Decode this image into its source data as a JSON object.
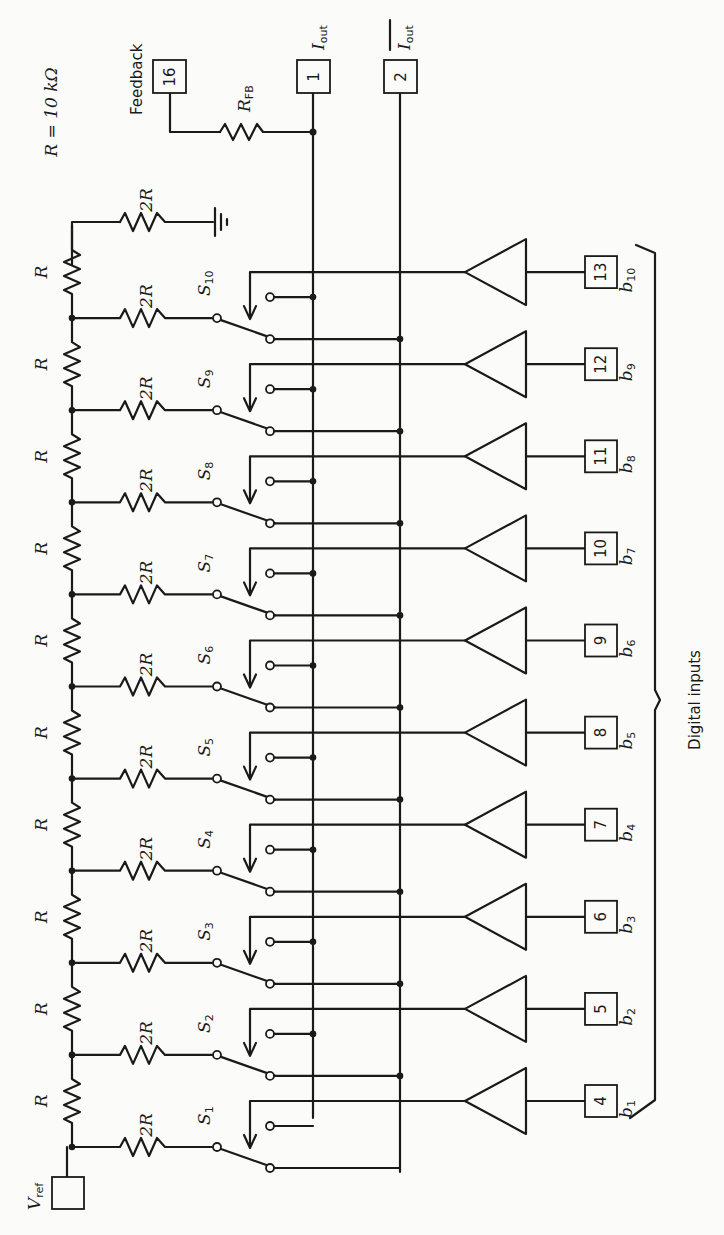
{
  "diagram": {
    "type": "R-2R ladder 10-bit multiplying DAC (rotated 90°)",
    "resistor_note": "R = 10 kΩ",
    "vref_label": "V",
    "vref_sub": "ref",
    "ladder_series_label": "R",
    "ladder_shunt_label": "2R",
    "feedback_label": "Feedback",
    "rfb_label": "R",
    "rfb_sub": "FB",
    "iout_label": "I",
    "iout_sub": "out",
    "iout_bar_label": "I",
    "iout_bar_sub": "out",
    "digital_inputs_label": "Digital inputs",
    "pins": {
      "feedback": "16",
      "iout": "1",
      "iout_bar": "2"
    },
    "bits": [
      {
        "switch": "S",
        "switch_sub": "1",
        "pin": "4",
        "bit": "b",
        "bit_sub": "1"
      },
      {
        "switch": "S",
        "switch_sub": "2",
        "pin": "5",
        "bit": "b",
        "bit_sub": "2"
      },
      {
        "switch": "S",
        "switch_sub": "3",
        "pin": "6",
        "bit": "b",
        "bit_sub": "3"
      },
      {
        "switch": "S",
        "switch_sub": "4",
        "pin": "7",
        "bit": "b",
        "bit_sub": "4"
      },
      {
        "switch": "S",
        "switch_sub": "5",
        "pin": "8",
        "bit": "b",
        "bit_sub": "5"
      },
      {
        "switch": "S",
        "switch_sub": "6",
        "pin": "9",
        "bit": "b",
        "bit_sub": "6"
      },
      {
        "switch": "S",
        "switch_sub": "7",
        "pin": "10",
        "bit": "b",
        "bit_sub": "7"
      },
      {
        "switch": "S",
        "switch_sub": "8",
        "pin": "11",
        "bit": "b",
        "bit_sub": "8"
      },
      {
        "switch": "S",
        "switch_sub": "9",
        "pin": "12",
        "bit": "b",
        "bit_sub": "9"
      },
      {
        "switch": "S",
        "switch_sub": "10",
        "pin": "13",
        "bit": "b",
        "bit_sub": "10"
      }
    ],
    "colors": {
      "ink": "#1a1a1a",
      "paper": "#fbfbf9"
    }
  }
}
